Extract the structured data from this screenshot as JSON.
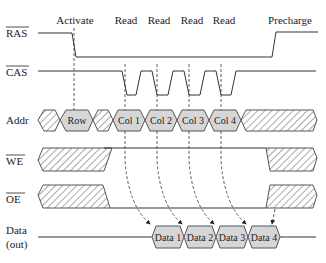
{
  "diagram": {
    "phases": [
      "Activate",
      "Read",
      "Read",
      "Read",
      "Read",
      "Precharge"
    ],
    "signals": [
      {
        "name": "RAS",
        "overbar": true
      },
      {
        "name": "CAS",
        "overbar": true
      },
      {
        "name": "Addr",
        "overbar": false
      },
      {
        "name": "WE",
        "overbar": true
      },
      {
        "name": "OE",
        "overbar": true
      },
      {
        "name": "Data",
        "sub": "(out)",
        "overbar": false
      }
    ],
    "addr_cells": [
      "Row",
      "Col 1",
      "Col 2",
      "Col 3",
      "Col 4"
    ],
    "data_cells": [
      "Data 1",
      "Data 2",
      "Data 3",
      "Data 4"
    ],
    "colors": {
      "cell_fill": "#d6d6d6",
      "line": "#333333",
      "background": "#ffffff"
    }
  }
}
